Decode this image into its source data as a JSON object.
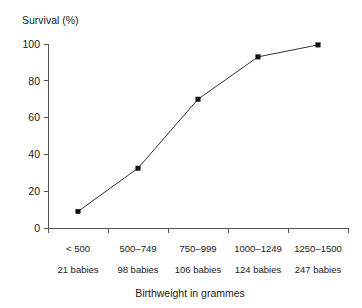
{
  "chart_data": {
    "type": "line",
    "title": "",
    "xlabel": "Birthweight in grammes",
    "ylabel": "Survival (%)",
    "categories": [
      "< 500",
      "500–749",
      "750–999",
      "1000–1249",
      "1250–1500"
    ],
    "secondary_labels": [
      "21 babies",
      "98 babies",
      "106 babies",
      "124 babies",
      "247 babies"
    ],
    "values": [
      9,
      32.5,
      70,
      93,
      99.5
    ],
    "ylim": [
      0,
      100
    ],
    "yticks": [
      0,
      20,
      40,
      60,
      80,
      100
    ],
    "ytick_labels": [
      "0",
      "20",
      "40",
      "60",
      "80",
      "100"
    ],
    "grid": false,
    "legend": "none",
    "marker": "square",
    "line_color": "#333333",
    "marker_color": "#111111",
    "axis_color": "#555555",
    "background": "#ffffff"
  },
  "labels": {
    "y_axis_title": "Survival (%)",
    "x_axis_title": "Birthweight in grammes"
  }
}
